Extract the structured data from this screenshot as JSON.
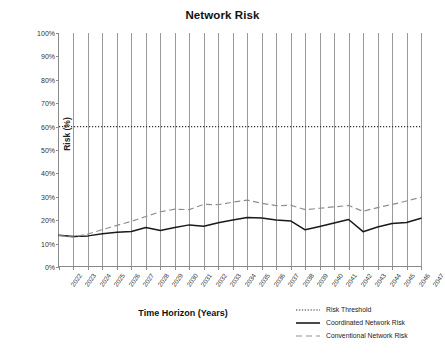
{
  "chart_data": {
    "type": "line",
    "title": "Network Risk",
    "xlabel": "Time Horizon (Years)",
    "ylabel": "Risk (%)",
    "categories": [
      "2022",
      "2023",
      "2024",
      "2025",
      "2026",
      "2027",
      "2028",
      "2029",
      "2030",
      "2031",
      "2032",
      "2033",
      "2034",
      "2035",
      "2036",
      "2037",
      "2038",
      "2039",
      "2040",
      "2041",
      "2042",
      "2043",
      "2044",
      "2045",
      "2046",
      "2047"
    ],
    "x": [
      2022,
      2023,
      2024,
      2025,
      2026,
      2027,
      2028,
      2029,
      2030,
      2031,
      2032,
      2033,
      2034,
      2035,
      2036,
      2037,
      2038,
      2039,
      2040,
      2041,
      2042,
      2043,
      2044,
      2045,
      2046,
      2047
    ],
    "ylim": [
      0,
      100
    ],
    "xlim": [
      2022,
      2047
    ],
    "ytick_labels": [
      "0%",
      "10%",
      "20%",
      "30%",
      "40%",
      "50%",
      "60%",
      "70%",
      "80%",
      "90%",
      "100%"
    ],
    "ytick_values": [
      0,
      10,
      20,
      30,
      40,
      50,
      60,
      70,
      80,
      90,
      100
    ],
    "grid": "vertical-only",
    "legend_position": "bottom-right",
    "series": [
      {
        "name": "Risk Threshold",
        "style": "dotted",
        "color": "#333333",
        "values": [
          60,
          60,
          60,
          60,
          60,
          60,
          60,
          60,
          60,
          60,
          60,
          60,
          60,
          60,
          60,
          60,
          60,
          60,
          60,
          60,
          60,
          60,
          60,
          60,
          60,
          60
        ]
      },
      {
        "name": "Coordinated Network Risk",
        "style": "solid",
        "color": "#1a1a1a",
        "values": [
          13.6,
          13.0,
          13.3,
          14.2,
          14.8,
          15.2,
          16.9,
          15.6,
          16.9,
          18.0,
          17.4,
          18.9,
          20.1,
          21.2,
          20.9,
          20.1,
          19.7,
          15.9,
          17.3,
          18.8,
          20.3,
          15.1,
          17.1,
          18.6,
          19.0,
          20.8
        ]
      },
      {
        "name": "Conventional Network Risk",
        "style": "dashed",
        "color": "#8f8f8f",
        "values": [
          13.4,
          12.8,
          14.1,
          16.0,
          17.8,
          19.5,
          21.6,
          23.6,
          24.7,
          24.5,
          26.8,
          26.6,
          27.7,
          28.6,
          27.2,
          26.2,
          26.4,
          24.5,
          25.1,
          25.7,
          26.3,
          23.8,
          25.4,
          26.7,
          28.2,
          29.8
        ]
      }
    ]
  },
  "legend": {
    "items": [
      {
        "label": "Risk Threshold"
      },
      {
        "label": "Coordinated Network Risk"
      },
      {
        "label": "Conventional Network Risk"
      }
    ]
  }
}
